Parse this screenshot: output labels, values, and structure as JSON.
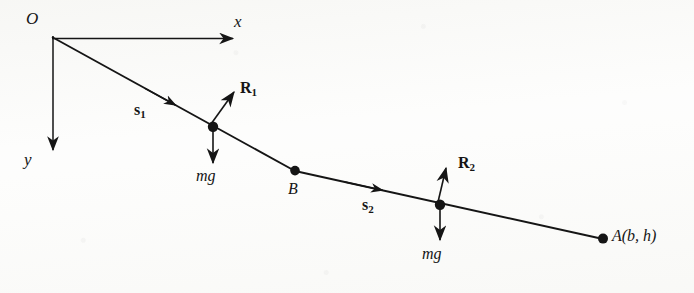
{
  "figure": {
    "type": "physics-free-body-diagram",
    "background_color": "#fdfdfc",
    "ink_color": "#151515",
    "axes": {
      "origin_label": "O",
      "x_axis_label": "x",
      "y_axis_label": "y",
      "origin_point": [
        52,
        36
      ],
      "x_arrow_tip": [
        238,
        39
      ],
      "y_arrow_tip": [
        52,
        156
      ]
    },
    "path": {
      "vertices": [
        {
          "name": "O",
          "x": 52,
          "y": 36
        },
        {
          "name": "B",
          "x": 295,
          "y": 171
        },
        {
          "name": "A",
          "x": 603,
          "y": 239
        }
      ],
      "segment_labels": [
        "s",
        "s"
      ]
    },
    "points": [
      {
        "label": "O",
        "x": 52,
        "y": 36
      },
      {
        "label": "B",
        "x": 295,
        "y": 171
      },
      {
        "label": "A(b, h)",
        "x": 603,
        "y": 239
      }
    ],
    "masses": [
      {
        "id": "mass-1",
        "x": 213,
        "y": 127,
        "weight_label": "mg",
        "normal_label": "R",
        "normal_subscript": "1"
      },
      {
        "id": "mass-2",
        "x": 440,
        "y": 205,
        "weight_label": "mg",
        "normal_label": "R",
        "normal_subscript": "2"
      }
    ],
    "labels": {
      "origin": "O",
      "x_axis": "x",
      "y_axis": "y",
      "point_b": "B",
      "point_a": "A(b, h)",
      "displacement_1": "s",
      "displacement_1_sub": "1",
      "displacement_2": "s",
      "displacement_2_sub": "2",
      "reaction_1": "R",
      "reaction_1_sub": "1",
      "reaction_2": "R",
      "reaction_2_sub": "2",
      "weight_1": "mg",
      "weight_2": "mg"
    }
  }
}
